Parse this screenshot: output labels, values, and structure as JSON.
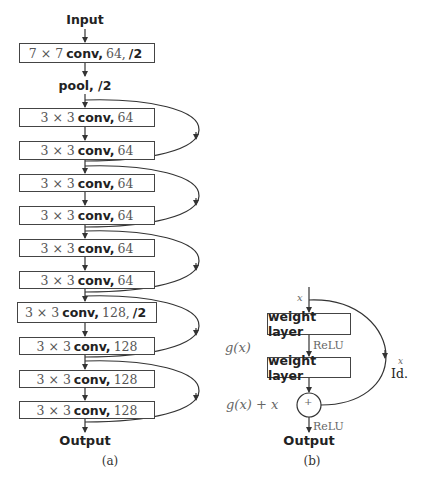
{
  "panel_a": {
    "input_label": "Input",
    "pool_label": "pool, /2",
    "output_label": "Output",
    "caption": "(a)",
    "layers": [
      {
        "kernel": "7 × 7",
        "op": "conv,",
        "channels": "64,",
        "stride": "/2"
      },
      {
        "kernel": "3 × 3",
        "op": "conv,",
        "channels": "64",
        "stride": ""
      },
      {
        "kernel": "3 × 3",
        "op": "conv,",
        "channels": "64",
        "stride": ""
      },
      {
        "kernel": "3 × 3",
        "op": "conv,",
        "channels": "64",
        "stride": ""
      },
      {
        "kernel": "3 × 3",
        "op": "conv,",
        "channels": "64",
        "stride": ""
      },
      {
        "kernel": "3 × 3",
        "op": "conv,",
        "channels": "64",
        "stride": ""
      },
      {
        "kernel": "3 × 3",
        "op": "conv,",
        "channels": "64",
        "stride": ""
      },
      {
        "kernel": "3 × 3",
        "op": "conv,",
        "channels": "128,",
        "stride": "/2"
      },
      {
        "kernel": "3 × 3",
        "op": "conv,",
        "channels": "128",
        "stride": ""
      },
      {
        "kernel": "3 × 3",
        "op": "conv,",
        "channels": "128",
        "stride": ""
      },
      {
        "kernel": "3 × 3",
        "op": "conv,",
        "channels": "128",
        "stride": ""
      }
    ],
    "skip_connections": 5
  },
  "panel_b": {
    "input_var": "x",
    "layer1": "weight layer",
    "relu1": "ReLU",
    "layer2": "weight layer",
    "gx_label": "g(x)",
    "sum_label": "g(x) + x",
    "plus": "+",
    "identity_var": "x",
    "identity_label": "Id.",
    "relu2": "ReLU",
    "output_label": "Output",
    "caption": "(b)"
  }
}
